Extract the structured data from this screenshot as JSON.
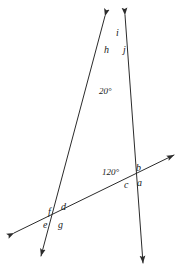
{
  "figure": {
    "width": 183,
    "height": 273,
    "background": "#ffffff",
    "stroke_color": "#2b2b2b",
    "stroke_width": 1
  },
  "angle_labels": [
    {
      "id": "deg-20",
      "text": "20°",
      "x": 99,
      "y": 87
    },
    {
      "id": "deg-120",
      "text": "120°",
      "x": 102,
      "y": 168
    }
  ],
  "point_labels": [
    {
      "id": "h",
      "text": "h",
      "x": 104,
      "y": 45
    },
    {
      "id": "i",
      "text": "i",
      "x": 116,
      "y": 28
    },
    {
      "id": "j",
      "text": "j",
      "x": 123,
      "y": 45
    },
    {
      "id": "b",
      "text": "b",
      "x": 136,
      "y": 163
    },
    {
      "id": "a",
      "text": "a",
      "x": 137,
      "y": 178
    },
    {
      "id": "c",
      "text": "c",
      "x": 124,
      "y": 180
    },
    {
      "id": "d",
      "text": "d",
      "x": 61,
      "y": 202
    },
    {
      "id": "f",
      "text": "f",
      "x": 48,
      "y": 207
    },
    {
      "id": "e",
      "text": "e",
      "x": 43,
      "y": 220
    },
    {
      "id": "g",
      "text": "g",
      "x": 58,
      "y": 220
    }
  ],
  "lines": [
    {
      "id": "left-line",
      "description": "line from upper-right arrow through top vertex down to lower-left arrow",
      "from": {
        "x": 105,
        "y": 16
      },
      "to": {
        "x": 41,
        "y": 256
      },
      "arrow_start": true,
      "arrow_end": true
    },
    {
      "id": "right-line",
      "description": "line from upper-left arrow through top vertex down to bottom arrow",
      "from": {
        "x": 125,
        "y": 15
      },
      "to": {
        "x": 143,
        "y": 263
      },
      "arrow_start": true,
      "arrow_end": true
    },
    {
      "id": "transversal",
      "description": "transversal from lower-left arrow to upper-right arrow",
      "from": {
        "x": 14,
        "y": 233
      },
      "to": {
        "x": 174,
        "y": 155
      },
      "arrow_start": true,
      "arrow_end": true
    }
  ],
  "vertices": [
    {
      "id": "top-vertex",
      "x": 117,
      "y": 55,
      "labels": [
        "h",
        "i",
        "j"
      ]
    },
    {
      "id": "right-vertex",
      "x": 133,
      "y": 177,
      "labels": [
        "a",
        "b",
        "c"
      ],
      "angle": "120°"
    },
    {
      "id": "left-vertex",
      "x": 57,
      "y": 214,
      "labels": [
        "d",
        "e",
        "f",
        "g"
      ]
    }
  ]
}
